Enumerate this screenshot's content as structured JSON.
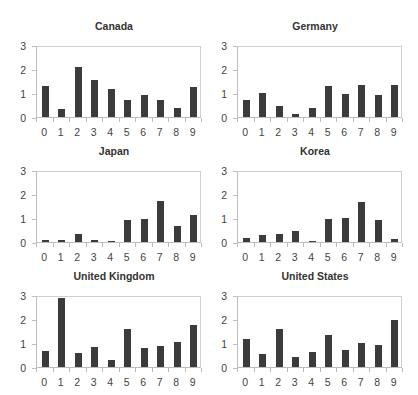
{
  "chart_data": [
    {
      "type": "bar",
      "title": "Canada",
      "categories": [
        "0",
        "1",
        "2",
        "3",
        "4",
        "5",
        "6",
        "7",
        "8",
        "9"
      ],
      "values": [
        1.3,
        0.32,
        2.12,
        1.55,
        1.2,
        0.73,
        0.95,
        0.72,
        0.38,
        1.25
      ],
      "xlabel": "",
      "ylabel": "",
      "yticks": [
        "0",
        "1",
        "2",
        "3"
      ],
      "ylim": [
        0,
        3
      ],
      "grid": false
    },
    {
      "type": "bar",
      "title": "Germany",
      "categories": [
        "0",
        "1",
        "2",
        "3",
        "4",
        "5",
        "6",
        "7",
        "8",
        "9"
      ],
      "values": [
        0.74,
        1.02,
        0.46,
        0.13,
        0.36,
        1.31,
        0.98,
        1.34,
        0.91,
        1.37
      ],
      "xlabel": "",
      "ylabel": "",
      "yticks": [
        "0",
        "1",
        "2",
        "3"
      ],
      "ylim": [
        0,
        3
      ],
      "grid": false
    },
    {
      "type": "bar",
      "title": "Japan",
      "categories": [
        "0",
        "1",
        "2",
        "3",
        "4",
        "5",
        "6",
        "7",
        "8",
        "9"
      ],
      "values": [
        0.1,
        0.1,
        0.32,
        0.1,
        0.03,
        0.92,
        0.98,
        1.75,
        0.67,
        1.13
      ],
      "xlabel": "",
      "ylabel": "",
      "yticks": [
        "0",
        "1",
        "2",
        "3"
      ],
      "ylim": [
        0,
        3
      ],
      "grid": false
    },
    {
      "type": "bar",
      "title": "Korea",
      "categories": [
        "0",
        "1",
        "2",
        "3",
        "4",
        "5",
        "6",
        "7",
        "8",
        "9"
      ],
      "values": [
        0.15,
        0.29,
        0.32,
        0.47,
        0.04,
        0.97,
        1.0,
        1.67,
        0.93,
        0.13
      ],
      "xlabel": "",
      "ylabel": "",
      "yticks": [
        "0",
        "1",
        "2",
        "3"
      ],
      "ylim": [
        0,
        3
      ],
      "grid": false
    },
    {
      "type": "bar",
      "title": "United Kingdom",
      "categories": [
        "0",
        "1",
        "2",
        "3",
        "4",
        "5",
        "6",
        "7",
        "8",
        "9"
      ],
      "values": [
        0.68,
        2.93,
        0.61,
        0.83,
        0.29,
        1.59,
        0.82,
        0.89,
        1.05,
        1.78
      ],
      "xlabel": "",
      "ylabel": "",
      "yticks": [
        "0",
        "1",
        "2",
        "3"
      ],
      "ylim": [
        0,
        3
      ],
      "grid": false
    },
    {
      "type": "bar",
      "title": "United States",
      "categories": [
        "0",
        "1",
        "2",
        "3",
        "4",
        "5",
        "6",
        "7",
        "8",
        "9"
      ],
      "values": [
        1.17,
        0.57,
        1.6,
        0.42,
        0.65,
        1.36,
        0.71,
        1.01,
        0.94,
        1.97
      ],
      "xlabel": "",
      "ylabel": "",
      "yticks": [
        "0",
        "1",
        "2",
        "3"
      ],
      "ylim": [
        0,
        3
      ],
      "grid": false
    }
  ],
  "style": {
    "bar_color": "#3b3b3b",
    "axis_color": "#bdbdbd",
    "text_color": "#444444"
  }
}
